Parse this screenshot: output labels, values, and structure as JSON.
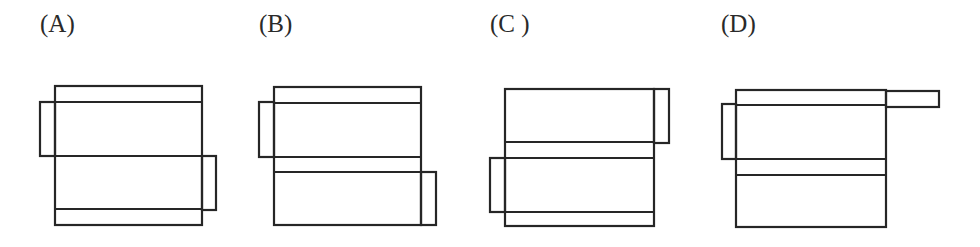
{
  "options": [
    {
      "label": "(A)",
      "label_x": 40,
      "figure": {
        "main": {
          "x": 55,
          "y": 86,
          "w": 147,
          "h": 139
        },
        "h_lines": [
          102,
          156,
          209
        ],
        "flaps": [
          {
            "position": "left",
            "x": 40,
            "y": 102,
            "w": 15,
            "h": 54
          },
          {
            "position": "right",
            "x": 202,
            "y": 156,
            "w": 14,
            "h": 54
          }
        ]
      }
    },
    {
      "label": "(B)",
      "label_x": 259,
      "figure": {
        "main": {
          "x": 274,
          "y": 87,
          "w": 147,
          "h": 138
        },
        "h_lines": [
          103,
          157,
          172
        ],
        "flaps": [
          {
            "position": "left",
            "x": 259,
            "y": 102,
            "w": 15,
            "h": 55
          },
          {
            "position": "right",
            "x": 421,
            "y": 172,
            "w": 15,
            "h": 53
          }
        ]
      }
    },
    {
      "label": "(C )",
      "label_x": 490,
      "figure": {
        "main": {
          "x": 505,
          "y": 89,
          "w": 149,
          "h": 137
        },
        "h_lines": [
          142,
          158,
          212
        ],
        "flaps": [
          {
            "position": "right",
            "x": 654,
            "y": 89,
            "w": 15,
            "h": 54
          },
          {
            "position": "left",
            "x": 490,
            "y": 158,
            "w": 15,
            "h": 54
          }
        ]
      }
    },
    {
      "label": "(D)",
      "label_x": 721,
      "figure": {
        "main": {
          "x": 736,
          "y": 90,
          "w": 150,
          "h": 137
        },
        "h_lines": [
          105,
          159,
          175
        ],
        "flaps": [
          {
            "position": "left",
            "x": 722,
            "y": 104,
            "w": 14,
            "h": 55
          },
          {
            "position": "top-right-strip",
            "x": 886,
            "y": 91,
            "w": 53,
            "h": 16
          }
        ]
      }
    }
  ]
}
